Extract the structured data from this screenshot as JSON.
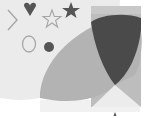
{
  "scene": {
    "width": 148,
    "height": 118,
    "background": "#ffffff",
    "colors": {
      "light_region": "#ebebeb",
      "bottom_strip": "#f1f1f1",
      "mid_gray": "#b3b3b3",
      "rect_gray": "#bdbdbd",
      "dark_gray": "#4a4a4a",
      "outline_gray": "#a6a6a6",
      "shape_dark": "#555555"
    },
    "shapes": [
      {
        "name": "light-quarter-circle",
        "kind": "circle",
        "fill": "light_region"
      },
      {
        "name": "right-rectangle",
        "kind": "rect",
        "fill": "rect_gray"
      },
      {
        "name": "large-lens",
        "kind": "ellipse",
        "fill": "mid_gray"
      },
      {
        "name": "dark-intersection-lens",
        "kind": "lens",
        "fill": "dark_gray"
      },
      {
        "name": "chevron-outline",
        "kind": "polyline",
        "stroke": "outline_gray"
      },
      {
        "name": "dark-heart",
        "kind": "path",
        "fill": "shape_dark"
      },
      {
        "name": "star-outline",
        "kind": "star",
        "stroke": "outline_gray"
      },
      {
        "name": "dark-star",
        "kind": "star",
        "fill": "shape_dark"
      },
      {
        "name": "circle-outline",
        "kind": "ellipse",
        "stroke": "outline_gray"
      },
      {
        "name": "dark-dot",
        "kind": "circle",
        "fill": "shape_dark"
      },
      {
        "name": "small-marker",
        "kind": "triangle",
        "fill": "shape_dark"
      }
    ]
  }
}
